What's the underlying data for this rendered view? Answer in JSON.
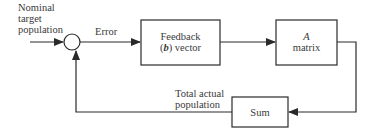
{
  "diagram": {
    "type": "feedback-control-block-diagram",
    "input_label": [
      "Nominal",
      "target",
      "population"
    ],
    "error_label": "Error",
    "feedback_block": {
      "line1": "Feedback",
      "line2_bold": "b",
      "line2_prefix": "(",
      "line2_suffix": ") vector"
    },
    "a_block": {
      "line1": "A",
      "line2": "matrix"
    },
    "sum_block": {
      "label": "Sum"
    },
    "output_label": [
      "Total actual",
      "population"
    ],
    "colors": {
      "line": "#2a2a2a",
      "text": "#3a3a3a",
      "background": "#ffffff"
    }
  }
}
